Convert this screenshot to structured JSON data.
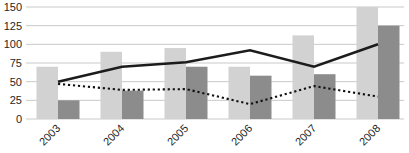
{
  "chart_data": {
    "type": "bar",
    "subtype": "combo-bar-line",
    "title": "",
    "xlabel": "",
    "ylabel": "",
    "categories": [
      "2003",
      "2004",
      "2005",
      "2006",
      "2007",
      "2008"
    ],
    "series": [
      {
        "name": "light-bars",
        "type": "bar",
        "color": "#d2d2d2",
        "values": [
          70,
          90,
          95,
          70,
          112,
          150
        ]
      },
      {
        "name": "dark-bars",
        "type": "bar",
        "color": "#8c8c8c",
        "values": [
          25,
          38,
          70,
          58,
          60,
          125
        ]
      },
      {
        "name": "solid-line",
        "type": "line",
        "style": "solid",
        "color": "#1c1c1c",
        "values": [
          50,
          70,
          76,
          92,
          70,
          100
        ]
      },
      {
        "name": "dotted-line",
        "type": "line",
        "style": "dotted",
        "color": "#111111",
        "values": [
          47,
          39,
          40,
          20,
          44,
          30
        ]
      }
    ],
    "yticks": [
      0,
      25,
      50,
      75,
      100,
      125,
      150
    ],
    "ylim": [
      0,
      150
    ],
    "grid": true,
    "gridline_color": "#c9c9c9",
    "legend": "none",
    "background": "#ffffff"
  }
}
